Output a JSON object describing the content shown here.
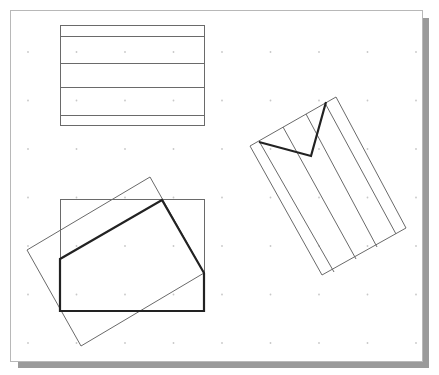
{
  "canvas": {
    "frame": {
      "x": 10,
      "y": 10,
      "w": 412,
      "h": 351
    },
    "background": "#ffffff",
    "border_color": "#b8b8b8",
    "shadow_color": "#9a9a9a"
  },
  "grid": {
    "dot_color": "#c8c8c8",
    "origin": [
      28,
      52
    ],
    "spacing": 48.5,
    "cols": 9,
    "rows": 7
  },
  "colors": {
    "thin_line": "#6a6a6a",
    "thick_line": "#222222"
  },
  "shapes": {
    "top_rect": {
      "rect": [
        60,
        25,
        144,
        100
      ],
      "stripes_y": [
        36,
        63,
        87,
        115
      ]
    },
    "bottom_group": {
      "rect": [
        60,
        199,
        144,
        112
      ],
      "rotated_rect": [
        [
          27,
          250
        ],
        [
          150,
          177
        ],
        [
          204,
          273
        ],
        [
          81,
          346
        ]
      ],
      "thick_polygon": [
        [
          60,
          259
        ],
        [
          162,
          200
        ],
        [
          204,
          273
        ],
        [
          204,
          311
        ],
        [
          60,
          311
        ]
      ]
    },
    "tilted_group": {
      "rotated_rect": [
        [
          250,
          146
        ],
        [
          336,
          97
        ],
        [
          406,
          228
        ],
        [
          322,
          275
        ]
      ],
      "stripes": [
        [
          [
            259,
            141
          ],
          [
            334,
            272
          ]
        ],
        [
          [
            283,
            127
          ],
          [
            356,
            259
          ]
        ],
        [
          [
            306,
            114
          ],
          [
            377,
            247
          ]
        ],
        [
          [
            325,
            103
          ],
          [
            396,
            234
          ]
        ]
      ],
      "thick_v": [
        [
          259,
          142
        ],
        [
          311,
          156
        ],
        [
          326,
          102
        ]
      ]
    }
  }
}
